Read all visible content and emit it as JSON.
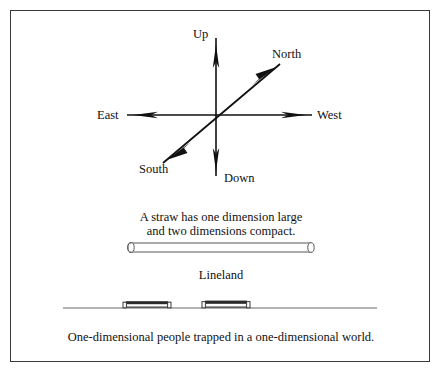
{
  "figure": {
    "title_text": "",
    "border_color": "#3a3a3a",
    "background_color": "#ffffff",
    "ink_color": "#111111"
  },
  "axes_diagram": {
    "labels": {
      "up": "Up",
      "down": "Down",
      "east": "East",
      "west": "West",
      "north": "North",
      "south": "South"
    },
    "icon_names": {
      "vertical_axis": "vertical-axis-arrow-icon",
      "horizontal_axis": "horizontal-axis-arrow-icon",
      "diagonal_axis": "diagonal-axis-arrow-icon"
    }
  },
  "straw_section": {
    "caption_line_1": "A straw has one dimension large",
    "caption_line_2": "and two dimensions compact.",
    "shape_name": "straw-cylinder"
  },
  "lineland_section": {
    "title": "Lineland",
    "caption": "One-dimensional people trapped in a one-dimensional world.",
    "people_count": 2
  }
}
